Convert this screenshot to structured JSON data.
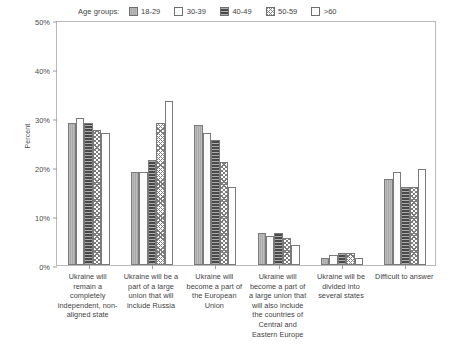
{
  "chart_data": {
    "type": "bar",
    "title": "",
    "xlabel": "",
    "ylabel": "Percent",
    "ylim": [
      0,
      50
    ],
    "ytick_labels": [
      "0%",
      "10%",
      "20%",
      "30%",
      "40%",
      "50%"
    ],
    "ytick_values": [
      0,
      10,
      20,
      30,
      40,
      50
    ],
    "grid": false,
    "legend_position": "top-center-inside",
    "legend_title": "Age groups:",
    "categories": [
      "Ukraine will remain a completely independent, non-aligned state",
      "Ukraine will be a part of a large union that will include Russia",
      "Ukraine will become a part of the European Union",
      "Ukraine will become a part of a large union that will also include the countries of Central and Eastern Europe",
      "Ukraine will be divided into several states",
      "Difficult to answer"
    ],
    "series": [
      {
        "name": "18-29",
        "pattern": "solid-gray",
        "values": [
          29.0,
          19.0,
          28.5,
          6.5,
          1.5,
          17.5
        ]
      },
      {
        "name": "30-39",
        "pattern": "white",
        "values": [
          30.0,
          19.0,
          27.0,
          6.0,
          2.0,
          19.0
        ]
      },
      {
        "name": "40-49",
        "pattern": "dark-hlines",
        "values": [
          29.0,
          21.5,
          25.5,
          6.5,
          2.5,
          16.0
        ]
      },
      {
        "name": "50-59",
        "pattern": "crosshatch",
        "values": [
          27.5,
          29.0,
          21.0,
          5.5,
          2.5,
          16.0
        ]
      },
      {
        "name": ">60",
        "pattern": "open",
        "values": [
          27.0,
          33.5,
          16.0,
          4.0,
          1.5,
          19.5
        ]
      }
    ]
  },
  "colors": {
    "axis": "#b9b9b9",
    "tick": "#9a9a9a",
    "text": "#3f3f3f",
    "bar_outline": "#7a7a7a",
    "series_18_29": "#a9a9a9",
    "series_30_39": "#fbfbfb",
    "series_40_49": "#4a4a4a",
    "series_50_59": "#ffffff",
    "series_60_plus": "#ffffff",
    "background": "#ffffff"
  }
}
